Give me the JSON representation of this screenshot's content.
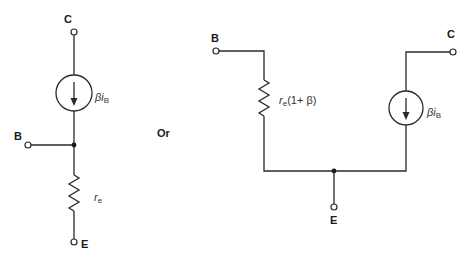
{
  "left_circuit": {
    "collector_label": "C",
    "base_label": "B",
    "emitter_label": "E",
    "source_label_main": "βi",
    "source_label_sub": "B",
    "resistor_label_main": "r",
    "resistor_label_sub": "e"
  },
  "separator": {
    "text": "Or"
  },
  "right_circuit": {
    "collector_label": "C",
    "base_label": "B",
    "emitter_label": "E",
    "source_label_main": "βi",
    "source_label_sub": "B",
    "resistor_label_main": "r",
    "resistor_label_sub": "e",
    "resistor_label_tail": "(1+ β)"
  }
}
